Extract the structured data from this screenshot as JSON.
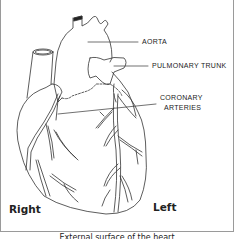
{
  "diagram": {
    "labels": {
      "aorta": "Aorta",
      "pulmonary_trunk": "Pulmonary Trunk",
      "coronary_arteries_line1": "Coronary",
      "coronary_arteries_line2": "Arteries"
    },
    "sides": {
      "right": "Right",
      "left": "Left"
    },
    "caption": "External surface of the heart",
    "colors": {
      "line": "#333333",
      "frame": "#9a9a9a",
      "background": "#ffffff"
    }
  }
}
